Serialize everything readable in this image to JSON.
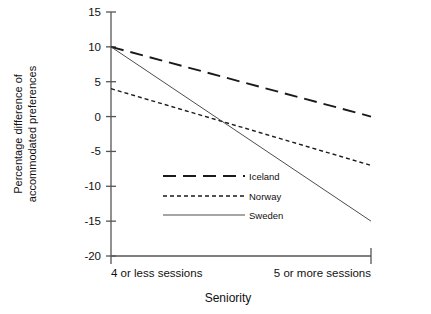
{
  "chart_data": {
    "type": "line",
    "title": "",
    "subtitle": "",
    "xlabel": "Seniority",
    "ylabel": "Percentage difference of accommodated preferences",
    "ylabel_line1": "Percentage difference of",
    "ylabel_line2": "accommodated preferences",
    "categories": [
      "4 or less sessions",
      "5 or more sessions"
    ],
    "x": [
      0,
      1
    ],
    "ylim": [
      -20,
      15
    ],
    "yticks": [
      15,
      10,
      5,
      0,
      -5,
      -10,
      -15,
      -20
    ],
    "ytick_labels": [
      "15",
      "10",
      "5",
      "0",
      "-5",
      "-10",
      "-15",
      "-20"
    ],
    "grid": false,
    "legend_position": "center",
    "series": [
      {
        "name": "Iceland",
        "values": [
          10,
          0
        ],
        "linestyle": "long-dash",
        "color": "#1a1a1a"
      },
      {
        "name": "Norway",
        "values": [
          4,
          -7
        ],
        "linestyle": "short-dash",
        "color": "#1a1a1a"
      },
      {
        "name": "Sweden",
        "values": [
          10,
          -15
        ],
        "linestyle": "solid",
        "color": "#4d4d4d"
      }
    ],
    "legend_entries": [
      "Iceland",
      "Norway",
      "Sweden"
    ],
    "axis_color": "#555555"
  }
}
